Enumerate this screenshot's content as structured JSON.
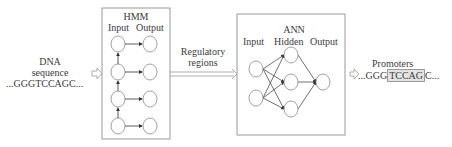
{
  "input": {
    "label_line1": "DNA",
    "label_line2": "sequence",
    "sequence": "...GGGTCCAGC..."
  },
  "hmm": {
    "title": "HMM",
    "col_input": "Input",
    "col_output": "Output",
    "states": 4
  },
  "connector": {
    "label_line1": "Regulatory",
    "label_line2": "regions"
  },
  "ann": {
    "title": "ANN",
    "col_input": "Input",
    "col_hidden": "Hidden",
    "col_output": "Output",
    "layers": {
      "input": 2,
      "hidden": 3,
      "output": 1
    }
  },
  "output": {
    "label": "Promoters",
    "seq_prefix": "...GGG",
    "seq_highlight": "TCCAG",
    "seq_suffix": "C..."
  },
  "colors": {
    "stroke": "#555555",
    "box_border": "#9a9a9a",
    "node_border": "#8a8a8a",
    "highlight_bg": "#e4e4e4"
  }
}
